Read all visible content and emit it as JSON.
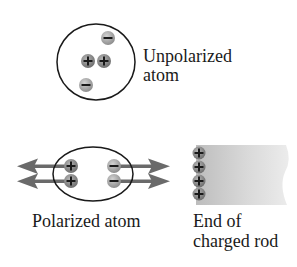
{
  "unpolarized": {
    "label_line1": "Unpolarized",
    "label_line2": "atom",
    "charges": [
      {
        "sign": "-",
        "x": 108,
        "y": 38
      },
      {
        "sign": "+",
        "x": 88,
        "y": 61
      },
      {
        "sign": "+",
        "x": 104,
        "y": 61
      },
      {
        "sign": "-",
        "x": 86,
        "y": 85
      }
    ]
  },
  "polarized": {
    "label": "Polarized atom",
    "charges": [
      {
        "sign": "+",
        "x": 71,
        "y": 166
      },
      {
        "sign": "+",
        "x": 71,
        "y": 181
      },
      {
        "sign": "-",
        "x": 114,
        "y": 166
      },
      {
        "sign": "-",
        "x": 114,
        "y": 181
      }
    ],
    "arrows": "forces pulling charges apart"
  },
  "rod": {
    "label_line1": "End of",
    "label_line2": "charged rod",
    "charges": [
      {
        "sign": "+",
        "y": 153
      },
      {
        "sign": "+",
        "y": 167
      },
      {
        "sign": "+",
        "y": 181
      },
      {
        "sign": "+",
        "y": 194
      }
    ]
  },
  "colors": {
    "outline": "#1a1a1a",
    "positive_fill": "#8c8c8c",
    "negative_fill": "#ababab",
    "arrow": "#6a6a6a",
    "rod_fill": "#d8d8d8"
  }
}
